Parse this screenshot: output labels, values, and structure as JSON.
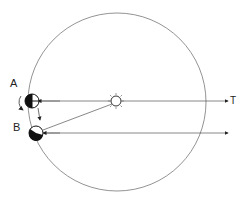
{
  "diagram": {
    "type": "sidereal-vs-solar-day",
    "labels": {
      "earth_a": "A",
      "earth_b": "B",
      "direction": "T"
    },
    "elements": [
      "orbit-circle",
      "sun",
      "earth-a",
      "earth-b",
      "rotation-arrow",
      "orbit-motion-arrow",
      "line-a-to-star",
      "line-b-to-star",
      "line-b-to-sun"
    ],
    "colors": {
      "stroke": "#555555",
      "earth_dark": "#111111",
      "earth_light": "#ffffff"
    }
  }
}
